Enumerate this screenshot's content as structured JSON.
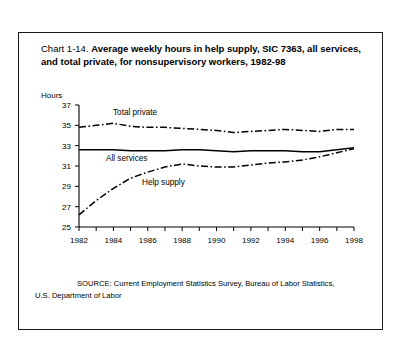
{
  "title": {
    "prefix": "Chart 1-14. ",
    "main": "Average weekly hours in help supply, SIC 7363, all services, and total private, for nonsupervisory workers, 1982-98"
  },
  "axis_unit_label": "Hours",
  "source": {
    "line1": "SOURCE: Current Employment Statistics Survey, Bureau of Labor Statistics,",
    "line2": "U.S. Department of Labor"
  },
  "series_labels": {
    "total_private": "Total private",
    "all_services": "All services",
    "help_supply": "Help supply"
  },
  "colors": {
    "ink": "#000000",
    "frame": "#1a1a1a",
    "background": "#ffffff"
  },
  "chart_data": {
    "type": "line",
    "title": "Average weekly hours in help supply, SIC 7363, all services, and total private, for nonsupervisory workers, 1982-98",
    "xlabel": "",
    "ylabel": "Hours",
    "xlim": [
      1982,
      1998
    ],
    "ylim": [
      25,
      37
    ],
    "yticks": [
      25,
      27,
      29,
      31,
      33,
      35,
      37
    ],
    "xticks": [
      1982,
      1983,
      1984,
      1985,
      1986,
      1987,
      1988,
      1989,
      1990,
      1991,
      1992,
      1993,
      1994,
      1995,
      1996,
      1997,
      1998
    ],
    "xtick_labels_shown": [
      1982,
      1984,
      1986,
      1988,
      1990,
      1992,
      1994,
      1996,
      1998
    ],
    "grid": false,
    "legend": "inline-annotations",
    "x": [
      1982,
      1983,
      1984,
      1985,
      1986,
      1987,
      1988,
      1989,
      1990,
      1991,
      1992,
      1993,
      1994,
      1995,
      1996,
      1997,
      1998
    ],
    "series": [
      {
        "name": "Total private",
        "style": "dash-dot",
        "values": [
          34.8,
          35.0,
          35.2,
          34.9,
          34.8,
          34.8,
          34.7,
          34.6,
          34.5,
          34.3,
          34.4,
          34.5,
          34.6,
          34.5,
          34.4,
          34.6,
          34.6
        ]
      },
      {
        "name": "All services",
        "style": "solid",
        "values": [
          32.6,
          32.6,
          32.6,
          32.5,
          32.5,
          32.5,
          32.6,
          32.6,
          32.5,
          32.4,
          32.5,
          32.5,
          32.5,
          32.4,
          32.4,
          32.6,
          32.8
        ]
      },
      {
        "name": "Help supply",
        "style": "dash-dot",
        "values": [
          26.2,
          27.6,
          28.8,
          29.8,
          30.4,
          30.9,
          31.2,
          31.0,
          30.9,
          30.9,
          31.1,
          31.3,
          31.4,
          31.6,
          31.9,
          32.3,
          32.7
        ]
      }
    ]
  }
}
